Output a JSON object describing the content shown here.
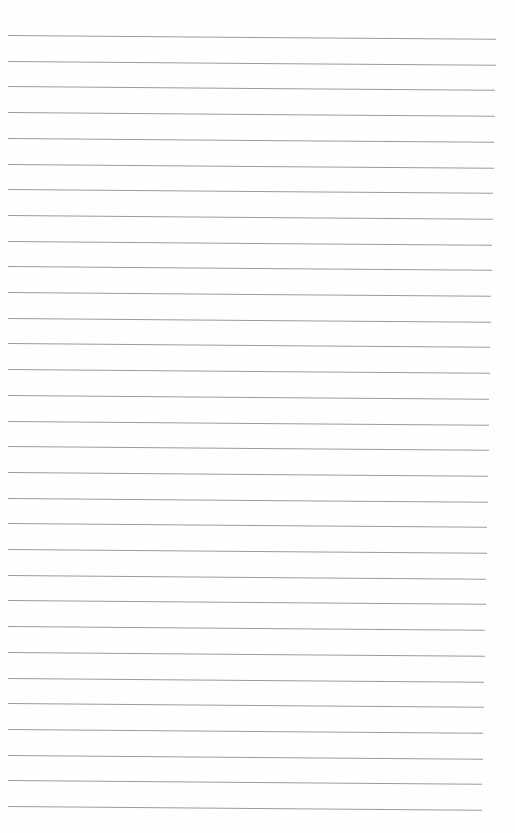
{
  "page": {
    "type": "lined-paper",
    "background": "#fefefe",
    "line_color": "#9a9a9a",
    "line_count": 31,
    "first_line_y": 35,
    "line_spacing": 25.7,
    "left_x": 8,
    "right_x_top": 496,
    "right_x_bottom": 482,
    "tilt_deg": 0.45
  }
}
